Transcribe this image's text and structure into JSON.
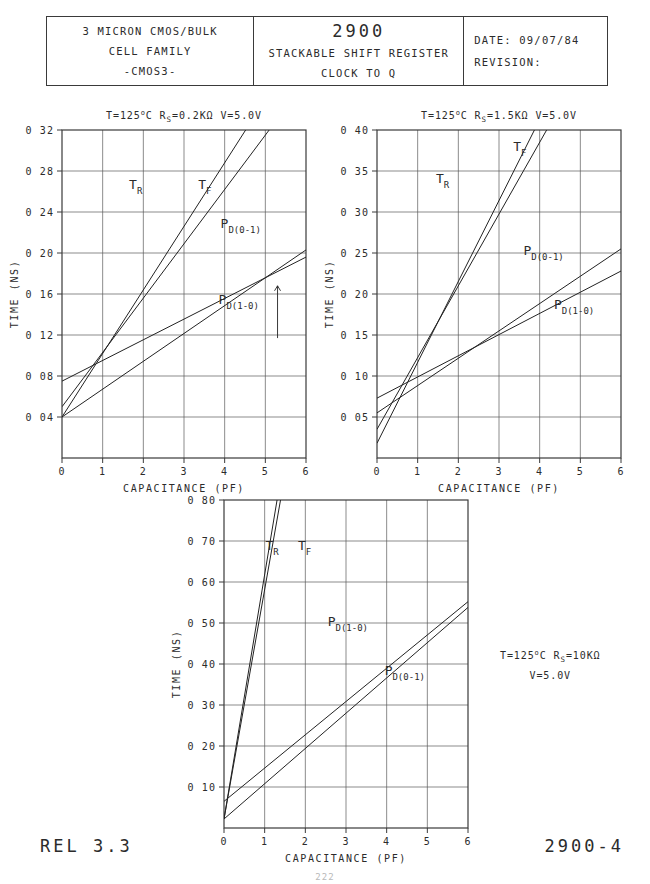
{
  "title_block": {
    "left": {
      "line1": "3 MICRON CMOS/BULK",
      "line2": "CELL FAMILY",
      "line3": "-CMOS3-"
    },
    "middle": {
      "part_number": "2900",
      "description": "STACKABLE SHIFT REGISTER",
      "measurement": "CLOCK TO Q"
    },
    "right": {
      "date_label": "DATE:",
      "date_value": "09/07/84",
      "revision_label": "REVISION:",
      "revision_value": ""
    }
  },
  "footer": {
    "release": "REL 3.3",
    "drawing_number": "2900-4",
    "page_number": "222"
  },
  "standalone_note": {
    "line1_pre": "T=125",
    "line1_deg": "o",
    "line1_mid": "C  R",
    "line1_sub": "S",
    "line1_post": "=10KΩ",
    "line2": "V=5.0V"
  },
  "chart_data": [
    {
      "id": "chart-rs-0p2k",
      "type": "line",
      "title_pre": "T=125",
      "title_deg": "o",
      "title_mid": "C  R",
      "title_sub": "S",
      "title_post": "=0.2KΩ  V=5.0V",
      "xlabel": "CAPACITANCE (PF)",
      "ylabel": "TIME (NS)",
      "xlim": [
        0,
        6
      ],
      "ylim": [
        0.0,
        0.32
      ],
      "xticks": [
        0,
        1,
        2,
        3,
        4,
        5,
        6
      ],
      "xticklabels": [
        "0",
        "1",
        "2",
        "3",
        "4",
        "5",
        "6"
      ],
      "yticks": [
        0.04,
        0.08,
        0.12,
        0.16,
        0.2,
        0.24,
        0.28,
        0.32
      ],
      "yticklabels": [
        "0 04",
        "0 08",
        "0 12",
        "0 16",
        "0 20",
        "0 24",
        "0 28",
        "0 32"
      ],
      "grid": true,
      "series": [
        {
          "name": "TR",
          "x": [
            0,
            6
          ],
          "y": [
            0.04,
            0.412
          ]
        },
        {
          "name": "TF",
          "x": [
            0,
            6
          ],
          "y": [
            0.05,
            0.368
          ]
        },
        {
          "name": "PD(0-1)",
          "x": [
            0,
            6
          ],
          "y": [
            0.04,
            0.203
          ]
        },
        {
          "name": "PD(1-0)",
          "x": [
            0,
            6
          ],
          "y": [
            0.075,
            0.196
          ]
        }
      ],
      "annotations": [
        {
          "name": "TR",
          "label": "T",
          "sub": "R",
          "x": 1.65,
          "y": 0.262
        },
        {
          "name": "TF",
          "label": "T",
          "sub": "F",
          "x": 3.35,
          "y": 0.262
        },
        {
          "name": "PD(0-1)",
          "label": "P",
          "sub": "D(0-1)",
          "x": 3.9,
          "y": 0.224
        },
        {
          "name": "PD(1-0)",
          "label": "P",
          "sub": "D(1-0)",
          "x": 3.85,
          "y": 0.15
        }
      ],
      "arrow": {
        "x": 5.3,
        "y_from": 0.117,
        "y_to": 0.168
      }
    },
    {
      "id": "chart-rs-1p5k",
      "type": "line",
      "title_pre": "T=125",
      "title_deg": "o",
      "title_mid": "C  R",
      "title_sub": "S",
      "title_post": "=1.5KΩ  V=5.0V",
      "xlabel": "CAPACITANCE (PF)",
      "ylabel": "TIME (NS)",
      "xlim": [
        0,
        6
      ],
      "ylim": [
        0.0,
        0.4
      ],
      "xticks": [
        0,
        1,
        2,
        3,
        4,
        5,
        6
      ],
      "xticklabels": [
        "0",
        "1",
        "2",
        "3",
        "4",
        "5",
        "6"
      ],
      "yticks": [
        0.05,
        0.1,
        0.15,
        0.2,
        0.25,
        0.3,
        0.35,
        0.4
      ],
      "yticklabels": [
        "0 05",
        "0 10",
        "0 15",
        "0 20",
        "0 25",
        "0 30",
        "0 35",
        "0 40"
      ],
      "grid": true,
      "series": [
        {
          "name": "TR",
          "x": [
            0,
            6
          ],
          "y": [
            0.018,
            0.61
          ]
        },
        {
          "name": "TF",
          "x": [
            0,
            6
          ],
          "y": [
            0.035,
            0.56
          ]
        },
        {
          "name": "PD(0-1)",
          "x": [
            0,
            6
          ],
          "y": [
            0.055,
            0.255
          ]
        },
        {
          "name": "PD(1-0)",
          "x": [
            0,
            6
          ],
          "y": [
            0.073,
            0.228
          ]
        }
      ],
      "annotations": [
        {
          "name": "TR",
          "label": "T",
          "sub": "R",
          "x": 1.45,
          "y": 0.335
        },
        {
          "name": "TF",
          "label": "T",
          "sub": "F",
          "x": 3.35,
          "y": 0.375
        },
        {
          "name": "PD(0-1)",
          "label": "P",
          "sub": "D(0-1)",
          "x": 3.6,
          "y": 0.248
        },
        {
          "name": "PD(1-0)",
          "label": "P",
          "sub": "D(1-0)",
          "x": 4.35,
          "y": 0.182
        }
      ],
      "arrow": null
    },
    {
      "id": "chart-rs-10k",
      "type": "line",
      "title_pre": "",
      "title_deg": "",
      "title_mid": "",
      "title_sub": "",
      "title_post": "",
      "xlabel": "CAPACITANCE (PF)",
      "ylabel": "TIME (NS)",
      "xlim": [
        0,
        6
      ],
      "ylim": [
        0.0,
        0.8
      ],
      "xticks": [
        0,
        1,
        2,
        3,
        4,
        5,
        6
      ],
      "xticklabels": [
        "0",
        "1",
        "2",
        "3",
        "4",
        "5",
        "6"
      ],
      "yticks": [
        0.1,
        0.2,
        0.3,
        0.4,
        0.5,
        0.6,
        0.7,
        0.8
      ],
      "yticklabels": [
        "0 10",
        "0 20",
        "0 30",
        "0 40",
        "0 50",
        "0 60",
        "0 70",
        "0 80"
      ],
      "grid": true,
      "series": [
        {
          "name": "TR",
          "x": [
            0,
            6
          ],
          "y": [
            0.022,
            3.6
          ]
        },
        {
          "name": "TF",
          "x": [
            0,
            6
          ],
          "y": [
            0.022,
            3.38
          ]
        },
        {
          "name": "PD(1-0)",
          "x": [
            0,
            6
          ],
          "y": [
            0.065,
            0.552
          ]
        },
        {
          "name": "PD(0-1)",
          "x": [
            0,
            6
          ],
          "y": [
            0.022,
            0.538
          ]
        }
      ],
      "annotations": [
        {
          "name": "TR",
          "label": "T",
          "sub": "R",
          "x": 1.02,
          "y": 0.678
        },
        {
          "name": "TF",
          "label": "T",
          "sub": "F",
          "x": 1.82,
          "y": 0.678
        },
        {
          "name": "PD(1-0)",
          "label": "P",
          "sub": "D(1-0)",
          "x": 2.55,
          "y": 0.492
        },
        {
          "name": "PD(0-1)",
          "label": "P",
          "sub": "D(0-1)",
          "x": 3.95,
          "y": 0.372
        }
      ],
      "arrow": null
    }
  ]
}
